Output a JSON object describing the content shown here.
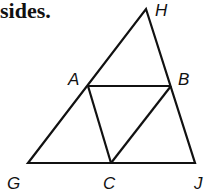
{
  "heading": "sides.",
  "diagram": {
    "stroke_color": "#111111",
    "points": {
      "H": {
        "x": 146,
        "y": 9
      },
      "A": {
        "x": 88,
        "y": 86
      },
      "B": {
        "x": 171,
        "y": 86
      },
      "G": {
        "x": 28,
        "y": 163
      },
      "C": {
        "x": 111,
        "y": 163
      },
      "J": {
        "x": 195,
        "y": 163
      }
    },
    "labels": {
      "H": "H",
      "A": "A",
      "B": "B",
      "G": "G",
      "C": "C",
      "J": "J"
    },
    "segments": [
      [
        "G",
        "H"
      ],
      [
        "H",
        "J"
      ],
      [
        "G",
        "J"
      ],
      [
        "A",
        "B"
      ],
      [
        "A",
        "C"
      ],
      [
        "B",
        "C"
      ]
    ]
  }
}
